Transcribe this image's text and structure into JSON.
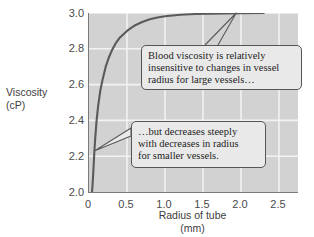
{
  "chart_data": {
    "type": "line",
    "title": "",
    "xlabel": "Radius of tube",
    "xlabel_units": "(mm)",
    "ylabel": "Viscosity",
    "ylabel_units": "(cP)",
    "xlim": [
      0,
      2.75
    ],
    "ylim": [
      2.0,
      3.0
    ],
    "xticks": [
      "0",
      "0.5",
      "1.0",
      "1.5",
      "2.0",
      "2.5"
    ],
    "xtick_values": [
      0,
      0.5,
      1.0,
      1.5,
      2.0,
      2.5
    ],
    "yticks": [
      "2.0",
      "2.2",
      "2.4",
      "2.6",
      "2.8",
      "3.0"
    ],
    "ytick_values": [
      2.0,
      2.2,
      2.4,
      2.6,
      2.8,
      3.0
    ],
    "grid": true,
    "grid_color": "#f2f2f2",
    "plot_background": "#d2d2d2",
    "line_color": "#5a5a5a",
    "legend": "none",
    "series": [
      {
        "name": "Blood viscosity vs tube radius",
        "x": [
          0.04,
          0.05,
          0.06,
          0.07,
          0.08,
          0.1,
          0.12,
          0.15,
          0.18,
          0.22,
          0.26,
          0.3,
          0.35,
          0.4,
          0.45,
          0.5,
          0.55,
          0.6,
          0.65,
          0.7,
          0.8,
          0.9,
          1.0,
          1.2,
          1.4,
          1.6,
          1.8,
          2.0,
          2.3
        ],
        "y": [
          2.0,
          2.06,
          2.14,
          2.22,
          2.29,
          2.4,
          2.48,
          2.57,
          2.63,
          2.7,
          2.75,
          2.79,
          2.83,
          2.86,
          2.88,
          2.9,
          2.915,
          2.93,
          2.94,
          2.95,
          2.965,
          2.975,
          2.982,
          2.99,
          2.994,
          2.996,
          2.998,
          2.999,
          3.0
        ]
      }
    ],
    "annotations": [
      {
        "id": "callout-large-vessels",
        "lines": [
          "Blood viscosity is relatively",
          "insensitive to changes in vessel",
          "radius for large vessels…"
        ],
        "points_to": {
          "x": 1.95,
          "y": 3.0
        }
      },
      {
        "id": "callout-small-vessels",
        "lines": [
          "…but decreases steeply",
          "with decreases in radius",
          "for smaller vessels."
        ],
        "points_to": {
          "x": 0.09,
          "y": 2.23
        }
      }
    ]
  },
  "axes": {
    "y_title_line1": "Viscosity",
    "y_title_line2": "(cP)",
    "x_title_line1": "Radius of tube",
    "x_title_line2": "(mm)"
  },
  "colors": {
    "plot_bg": "#d2d2d2",
    "grid": "#f2f2f2",
    "curve": "#5a5a5a",
    "axis": "#7a7a7a",
    "callout_bg": "#e9e9e9",
    "callout_border": "#555555",
    "text": "#3d3d3d"
  }
}
